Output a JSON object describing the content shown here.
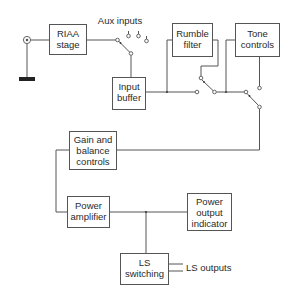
{
  "diagram": {
    "type": "audio amplifier block diagram",
    "blocks": {
      "riaa": {
        "line1": "RIAA",
        "line2": "stage"
      },
      "input_buffer": {
        "line1": "Input",
        "line2": "buffer"
      },
      "rumble": {
        "line1": "Rumble",
        "line2": "filter"
      },
      "tone": {
        "line1": "Tone",
        "line2": "controls"
      },
      "gain": {
        "line1": "Gain and",
        "line2": "balance",
        "line3": "controls"
      },
      "power_amp": {
        "line1": "Power",
        "line2": "amplifier"
      },
      "power_indicator": {
        "line1": "Power",
        "line2": "output",
        "line3": "indicator"
      },
      "ls_switching": {
        "line1": "LS",
        "line2": "switching"
      }
    },
    "labels": {
      "aux_inputs": "Aux inputs",
      "ls_outputs": "LS outputs"
    },
    "connections": [
      [
        "input-jack",
        "riaa"
      ],
      [
        "riaa",
        "input-selector-switch"
      ],
      [
        "aux-inputs",
        "input-selector-switch"
      ],
      [
        "input-selector-switch",
        "input_buffer"
      ],
      [
        "input_buffer",
        "rumble"
      ],
      [
        "input_buffer",
        "rumble-bypass-switch"
      ],
      [
        "rumble",
        "rumble-bypass-switch"
      ],
      [
        "rumble-bypass-switch",
        "tone"
      ],
      [
        "rumble-bypass-switch",
        "tone-bypass-switch"
      ],
      [
        "tone",
        "tone-bypass-switch"
      ],
      [
        "tone-bypass-switch",
        "gain"
      ],
      [
        "gain",
        "power_amp"
      ],
      [
        "power_amp",
        "power_indicator"
      ],
      [
        "power_amp",
        "ls_switching"
      ],
      [
        "ls_switching",
        "ls-outputs"
      ]
    ],
    "colors": {
      "line": "#555555",
      "text": "#2a2a2a",
      "background": "#ffffff"
    }
  }
}
